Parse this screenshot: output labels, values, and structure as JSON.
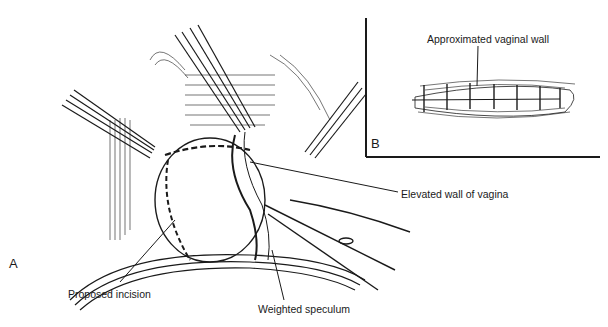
{
  "figure": {
    "panels": [
      {
        "id": "A",
        "label": "A"
      },
      {
        "id": "B",
        "label": "B"
      }
    ],
    "labels": {
      "approximated_vaginal_wall": "Approximated vaginal wall",
      "elevated_wall_of_vagina": "Elevated wall of vagina",
      "proposed_incision": "Proposed incision",
      "weighted_speculum": "Weighted speculum"
    },
    "colors": {
      "ink": "#1a1a1a",
      "background": "#ffffff"
    }
  }
}
